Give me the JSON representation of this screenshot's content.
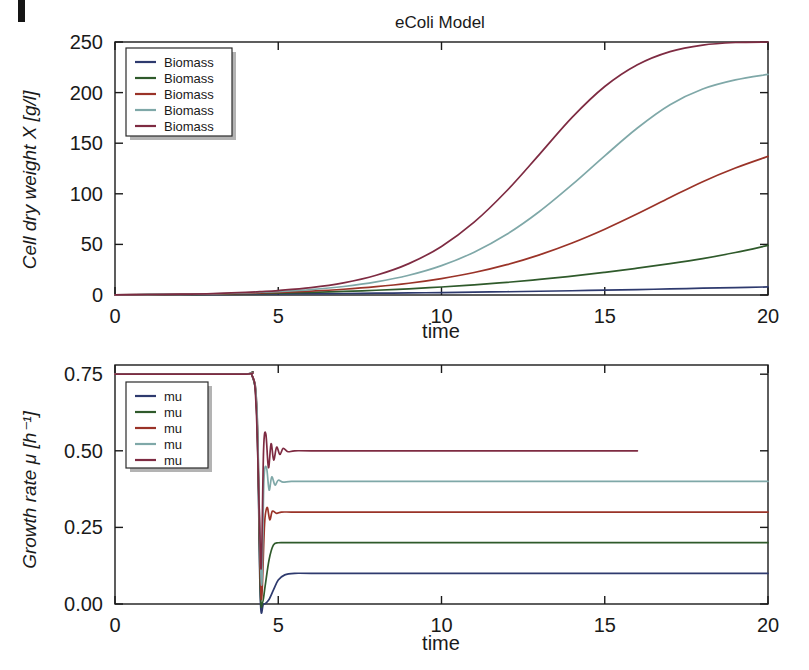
{
  "page": {
    "background": "#ffffff",
    "corner_mark_present": true
  },
  "chart_data": [
    {
      "id": "biomass",
      "type": "line",
      "title": "eColi Model",
      "xlabel": "time",
      "ylabel": "Cell dry weight X [g/l]",
      "xlim": [
        0,
        20
      ],
      "ylim": [
        0,
        250
      ],
      "xticks": [
        0,
        5,
        10,
        15,
        20
      ],
      "yticks": [
        0,
        50,
        100,
        150,
        200,
        250
      ],
      "xticklabels": [
        "0",
        "5",
        "10",
        "15",
        "20"
      ],
      "yticklabels": [
        "0",
        "50",
        "100",
        "150",
        "200",
        "250"
      ],
      "grid": false,
      "legend_position": "upper-left",
      "legend_entries": [
        "Biomass",
        "Biomass",
        "Biomass",
        "Biomass",
        "Biomass"
      ],
      "colors": [
        "#2E3A6E",
        "#2F5A2B",
        "#9A3328",
        "#7FA8A8",
        "#7E2B42"
      ],
      "x": [
        0,
        1,
        2,
        3,
        4,
        4.5,
        5,
        6,
        7,
        8,
        9,
        10,
        11,
        12,
        13,
        14,
        15,
        16,
        17,
        18,
        19,
        20
      ],
      "series": [
        {
          "name": "Biomass",
          "mu": 0.1,
          "final_value": 8,
          "values": [
            0.2,
            0.3,
            0.4,
            0.6,
            0.9,
            1.0,
            1.1,
            1.3,
            1.5,
            1.8,
            2.1,
            2.4,
            2.8,
            3.2,
            3.7,
            4.2,
            4.8,
            5.4,
            6.0,
            6.7,
            7.3,
            8.0
          ]
        },
        {
          "name": "Biomass",
          "mu": 0.2,
          "final_value": 49,
          "values": [
            0.2,
            0.3,
            0.5,
            0.8,
            1.3,
            1.6,
            1.9,
            2.6,
            3.5,
            4.7,
            6.1,
            7.9,
            10.0,
            12.5,
            15.4,
            18.7,
            22.4,
            26.5,
            31.0,
            36.0,
            42.0,
            49.0
          ]
        },
        {
          "name": "Biomass",
          "mu": 0.3,
          "final_value": 137,
          "values": [
            0.2,
            0.4,
            0.6,
            1.0,
            1.7,
            2.1,
            2.6,
            3.9,
            5.7,
            8.2,
            11.6,
            16.2,
            22.2,
            30.0,
            39.7,
            51.4,
            65.0,
            80.2,
            96.3,
            112.0,
            125.5,
            137.0
          ]
        },
        {
          "name": "Biomass",
          "mu": 0.4,
          "final_value": 218,
          "values": [
            0.2,
            0.4,
            0.7,
            1.2,
            2.1,
            2.7,
            3.4,
            5.4,
            8.4,
            12.9,
            19.5,
            29.0,
            42.3,
            60.0,
            82.5,
            109.0,
            137.5,
            165.0,
            188.0,
            203.5,
            212.5,
            218.0
          ]
        },
        {
          "name": "Biomass",
          "mu": 0.5,
          "final_value": 250,
          "values": [
            0.2,
            0.5,
            0.8,
            1.4,
            2.6,
            3.4,
            4.4,
            7.3,
            12.0,
            19.5,
            31.0,
            48.0,
            72.0,
            103.0,
            139.0,
            175.5,
            206.0,
            227.5,
            240.5,
            247.0,
            249.5,
            250.0
          ]
        }
      ]
    },
    {
      "id": "growth-rate",
      "type": "line",
      "title": "",
      "xlabel": "time",
      "ylabel": "Growth rate μ [h⁻¹]",
      "xlim": [
        0,
        20
      ],
      "ylim": [
        0,
        0.78
      ],
      "xticks": [
        0,
        5,
        10,
        15,
        20
      ],
      "yticks": [
        0,
        0.25,
        0.5,
        0.75
      ],
      "xticklabels": [
        "0",
        "5",
        "10",
        "15",
        "20"
      ],
      "yticklabels": [
        "0.00",
        "0.25",
        "0.50",
        "0.75"
      ],
      "grid": false,
      "legend_position": "upper-left",
      "legend_entries": [
        "mu",
        "mu",
        "mu",
        "mu",
        "mu"
      ],
      "colors": [
        "#2E3A6E",
        "#2F5A2B",
        "#9A3328",
        "#7FA8A8",
        "#7E2B42"
      ],
      "initial_value": 0.75,
      "drop_time": 4.45,
      "series": [
        {
          "name": "mu",
          "steady_value": 0.1,
          "x": [
            0,
            3.8,
            4.2,
            4.35,
            4.45,
            4.55,
            4.7,
            4.85,
            5.0,
            5.2,
            5.5,
            6.0,
            8,
            12,
            16,
            20
          ],
          "values": [
            0.75,
            0.75,
            0.745,
            0.6,
            0.02,
            0.0,
            0.012,
            0.045,
            0.078,
            0.095,
            0.1,
            0.1,
            0.1,
            0.1,
            0.1,
            0.1
          ]
        },
        {
          "name": "mu",
          "steady_value": 0.2,
          "x": [
            0,
            3.8,
            4.2,
            4.35,
            4.45,
            4.52,
            4.6,
            4.72,
            4.85,
            5.0,
            5.3,
            6.0,
            8,
            12,
            16,
            20
          ],
          "values": [
            0.75,
            0.75,
            0.745,
            0.6,
            0.05,
            0.005,
            0.06,
            0.145,
            0.192,
            0.2,
            0.2,
            0.2,
            0.2,
            0.2,
            0.2,
            0.2
          ]
        },
        {
          "name": "mu",
          "steady_value": 0.3,
          "x": [
            0,
            3.8,
            4.2,
            4.35,
            4.45,
            4.5,
            4.58,
            4.66,
            4.74,
            4.82,
            4.95,
            5.1,
            5.4,
            6.0,
            8,
            12,
            16,
            20
          ],
          "values": [
            0.75,
            0.75,
            0.745,
            0.62,
            0.1,
            0.03,
            0.26,
            0.315,
            0.275,
            0.303,
            0.296,
            0.3,
            0.3,
            0.3,
            0.3,
            0.3,
            0.3,
            0.3
          ]
        },
        {
          "name": "mu",
          "steady_value": 0.4,
          "x": [
            0,
            3.8,
            4.2,
            4.35,
            4.44,
            4.5,
            4.56,
            4.64,
            4.72,
            4.8,
            4.9,
            5.0,
            5.15,
            5.4,
            6.0,
            8,
            12,
            16,
            20
          ],
          "values": [
            0.75,
            0.75,
            0.745,
            0.63,
            0.2,
            0.07,
            0.4,
            0.445,
            0.372,
            0.415,
            0.388,
            0.404,
            0.398,
            0.4,
            0.4,
            0.4,
            0.4,
            0.4,
            0.4
          ]
        },
        {
          "name": "mu",
          "steady_value": 0.5,
          "x": [
            0,
            3.8,
            4.2,
            4.32,
            4.42,
            4.48,
            4.55,
            4.62,
            4.7,
            4.78,
            4.86,
            4.95,
            5.05,
            5.15,
            5.3,
            5.5,
            6.0,
            8,
            12,
            16,
            20
          ],
          "values": [
            0.75,
            0.75,
            0.745,
            0.65,
            0.3,
            0.12,
            0.5,
            0.555,
            0.445,
            0.523,
            0.47,
            0.512,
            0.488,
            0.508,
            0.497,
            0.5,
            0.5,
            0.5,
            0.5,
            0.5
          ]
        }
      ]
    }
  ]
}
